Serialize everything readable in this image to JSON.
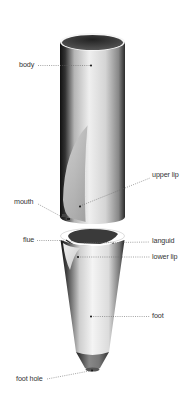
{
  "diagram": {
    "colors": {
      "background": "#ffffff",
      "label_text": "#333333",
      "leader_line": "#555555",
      "pipe_dark": "#1a1a1a",
      "pipe_light": "#e8e8e8"
    },
    "labels": {
      "body": "body",
      "upper_lip": "upper lip",
      "mouth": "mouth",
      "flue": "flue",
      "languid": "languid",
      "lower_lip": "lower lip",
      "foot": "foot",
      "foot_hole": "foot hole"
    }
  }
}
